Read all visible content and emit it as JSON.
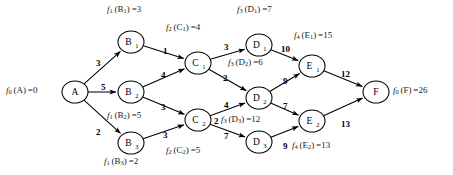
{
  "figure": {
    "type": "directed-acyclic-graph",
    "title": ""
  },
  "nodes": [
    {
      "id": "A",
      "label": "A",
      "sub": "",
      "cx": 75,
      "cy": 92,
      "rx": 13,
      "ry": 11
    },
    {
      "id": "B1",
      "label": "B",
      "sub": "1",
      "cx": 131,
      "cy": 42,
      "rx": 13,
      "ry": 11
    },
    {
      "id": "B2",
      "label": "B",
      "sub": "2",
      "cx": 131,
      "cy": 92,
      "rx": 13,
      "ry": 11
    },
    {
      "id": "B3",
      "label": "B",
      "sub": "3",
      "cx": 131,
      "cy": 143,
      "rx": 13,
      "ry": 11
    },
    {
      "id": "C1",
      "label": "C",
      "sub": "1",
      "cx": 198,
      "cy": 63,
      "rx": 13,
      "ry": 11
    },
    {
      "id": "C2",
      "label": "C",
      "sub": "2",
      "cx": 198,
      "cy": 120,
      "rx": 13,
      "ry": 11
    },
    {
      "id": "D1",
      "label": "D",
      "sub": "1",
      "cx": 259,
      "cy": 45,
      "rx": 13,
      "ry": 11
    },
    {
      "id": "D2",
      "label": "D",
      "sub": "2",
      "cx": 259,
      "cy": 98,
      "rx": 13,
      "ry": 11
    },
    {
      "id": "D3",
      "label": "D",
      "sub": "3",
      "cx": 259,
      "cy": 142,
      "rx": 13,
      "ry": 11
    },
    {
      "id": "E1",
      "label": "E",
      "sub": "1",
      "cx": 312,
      "cy": 66,
      "rx": 13,
      "ry": 11
    },
    {
      "id": "E2",
      "label": "E",
      "sub": "2",
      "cx": 312,
      "cy": 121,
      "rx": 13,
      "ry": 11
    },
    {
      "id": "F",
      "label": "F",
      "sub": "",
      "cx": 376,
      "cy": 92,
      "rx": 13,
      "ry": 11
    }
  ],
  "edges": [
    {
      "from": "A",
      "to": "B1",
      "weight": "3",
      "lx": 96,
      "ly": 58
    },
    {
      "from": "A",
      "to": "B2",
      "weight": "5",
      "lx": 101,
      "ly": 82
    },
    {
      "from": "A",
      "to": "B3",
      "weight": "2",
      "lx": 96,
      "ly": 127
    },
    {
      "from": "B1",
      "to": "C1",
      "weight": "1",
      "lx": 163,
      "ly": 46
    },
    {
      "from": "B2",
      "to": "C1",
      "weight": "4",
      "lx": 161,
      "ly": 70
    },
    {
      "from": "B2",
      "to": "C2",
      "weight": "3",
      "lx": 161,
      "ly": 102
    },
    {
      "from": "B3",
      "to": "C2",
      "weight": "3",
      "lx": 163,
      "ly": 130
    },
    {
      "from": "C1",
      "to": "D1",
      "weight": "3",
      "lx": 224,
      "ly": 42
    },
    {
      "from": "C1",
      "to": "D2",
      "weight": "2",
      "lx": 223,
      "ly": 73
    },
    {
      "from": "C2",
      "to": "D2",
      "weight": "4",
      "lx": 224,
      "ly": 100
    },
    {
      "from": "C2",
      "to": "D3",
      "weight": "7",
      "lx": 224,
      "ly": 131
    },
    {
      "from": "C2",
      "to": "D3b",
      "weight": "2",
      "lx": 214,
      "ly": 116
    },
    {
      "from": "D1",
      "to": "E1",
      "weight": "10",
      "lx": 281,
      "ly": 44
    },
    {
      "from": "D2",
      "to": "E1",
      "weight": "9",
      "lx": 283,
      "ly": 76
    },
    {
      "from": "D2",
      "to": "E2",
      "weight": "7",
      "lx": 283,
      "ly": 101
    },
    {
      "from": "D3",
      "to": "E2",
      "weight": "9",
      "lx": 283,
      "ly": 141
    },
    {
      "from": "E1",
      "to": "F",
      "weight": "12",
      "lx": 341,
      "ly": 69
    },
    {
      "from": "E2",
      "to": "F",
      "weight": "13",
      "lx": 341,
      "ly": 119
    }
  ],
  "value_labels": [
    {
      "id": "f0A",
      "f": "f",
      "fsub": "0",
      "arg": "A",
      "argsub": "",
      "value": "0",
      "x": 6,
      "y": 85,
      "align": "left"
    },
    {
      "id": "f1B1",
      "f": "f",
      "fsub": "1",
      "arg": "B",
      "argsub": "1",
      "value": "3",
      "x": 107,
      "y": 4,
      "align": "left"
    },
    {
      "id": "f2C1",
      "f": "f",
      "fsub": "2",
      "arg": "C",
      "argsub": "1",
      "value": "4",
      "x": 166,
      "y": 22,
      "align": "left"
    },
    {
      "id": "f3D1",
      "f": "f",
      "fsub": "3",
      "arg": "D",
      "argsub": "1",
      "value": "7",
      "x": 237,
      "y": 4,
      "align": "left"
    },
    {
      "id": "f4E1",
      "f": "f",
      "fsub": "4",
      "arg": "E",
      "argsub": "1",
      "value": "15",
      "x": 294,
      "y": 30,
      "align": "left"
    },
    {
      "id": "f3D2",
      "f": "f",
      "fsub": "3",
      "arg": "D",
      "argsub": "2",
      "value": "6",
      "x": 228,
      "y": 57,
      "align": "left"
    },
    {
      "id": "f1B2",
      "f": "f",
      "fsub": "1",
      "arg": "B",
      "argsub": "2",
      "value": "5",
      "x": 107,
      "y": 110,
      "align": "left"
    },
    {
      "id": "f3D3",
      "f": "f",
      "fsub": "3",
      "arg": "D",
      "argsub": "3",
      "value": "12",
      "x": 221,
      "y": 114,
      "align": "left"
    },
    {
      "id": "f4E2",
      "f": "f",
      "fsub": "4",
      "arg": "E",
      "argsub": "2",
      "value": "13",
      "x": 292,
      "y": 140,
      "align": "left"
    },
    {
      "id": "f2C2",
      "f": "f",
      "fsub": "2",
      "arg": "C",
      "argsub": "2",
      "value": "5",
      "x": 166,
      "y": 145,
      "align": "left"
    },
    {
      "id": "f1B3",
      "f": "f",
      "fsub": "1",
      "arg": "B",
      "argsub": "3",
      "value": "2",
      "x": 104,
      "y": 156,
      "align": "left"
    },
    {
      "id": "f0F",
      "f": "f",
      "fsub": "0",
      "arg": "F",
      "argsub": "",
      "value": "26",
      "x": 393,
      "y": 85,
      "align": "left"
    }
  ],
  "chart_data": {
    "type": "diagram",
    "stages": [
      "A",
      "B",
      "C",
      "D",
      "E",
      "F"
    ],
    "node_values": {
      "f0(A)": 0,
      "f1(B1)": 3,
      "f1(B2)": 5,
      "f1(B3)": 2,
      "f2(C1)": 4,
      "f2(C2)": 5,
      "f3(D1)": 7,
      "f3(D2)": 6,
      "f3(D3)": 12,
      "f4(E1)": 15,
      "f4(E2)": 13,
      "f0(F)": 26
    },
    "arc_weights": [
      {
        "arc": "A-B1",
        "w": 3
      },
      {
        "arc": "A-B2",
        "w": 5
      },
      {
        "arc": "A-B3",
        "w": 2
      },
      {
        "arc": "B1-C1",
        "w": 1
      },
      {
        "arc": "B2-C1",
        "w": 4
      },
      {
        "arc": "B2-C2",
        "w": 3
      },
      {
        "arc": "B3-C2",
        "w": 3
      },
      {
        "arc": "C1-D1",
        "w": 3
      },
      {
        "arc": "C1-D2",
        "w": 2
      },
      {
        "arc": "C2-D2",
        "w": 4
      },
      {
        "arc": "C2-D3",
        "w": 7
      },
      {
        "arc": "D1-E1",
        "w": 10
      },
      {
        "arc": "D2-E1",
        "w": 9
      },
      {
        "arc": "D2-E2",
        "w": 7
      },
      {
        "arc": "D3-E2",
        "w": 9
      },
      {
        "arc": "E1-F",
        "w": 12
      },
      {
        "arc": "E2-F",
        "w": 13
      }
    ]
  }
}
